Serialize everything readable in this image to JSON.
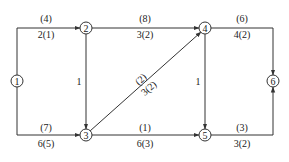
{
  "diagram": {
    "type": "network-graph",
    "colors": {
      "line": "#333333",
      "text": "#222222",
      "background": "#ffffff"
    },
    "nodes": [
      {
        "id": "1",
        "label": "1"
      },
      {
        "id": "2",
        "label": "2"
      },
      {
        "id": "3",
        "label": "3"
      },
      {
        "id": "4",
        "label": "4"
      },
      {
        "id": "5",
        "label": "5"
      },
      {
        "id": "6",
        "label": "6"
      }
    ],
    "edges": [
      {
        "from": "1",
        "to": "2",
        "top": "(4)",
        "bottom": "2(1)"
      },
      {
        "from": "1",
        "to": "3",
        "top": "(7)",
        "bottom": "6(5)"
      },
      {
        "from": "2",
        "to": "4",
        "top": "(8)",
        "bottom": "3(2)"
      },
      {
        "from": "2",
        "to": "3",
        "side": "1"
      },
      {
        "from": "3",
        "to": "4",
        "top": "(2)",
        "bottom": "3(2)"
      },
      {
        "from": "3",
        "to": "5",
        "top": "(1)",
        "bottom": "6(3)"
      },
      {
        "from": "4",
        "to": "5",
        "side": "1"
      },
      {
        "from": "4",
        "to": "6",
        "top": "(6)",
        "bottom": "4(2)"
      },
      {
        "from": "5",
        "to": "6",
        "top": "(3)",
        "bottom": "3(2)"
      }
    ]
  }
}
